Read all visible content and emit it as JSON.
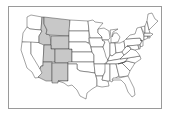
{
  "map": {
    "title": "Contiguous United States",
    "highlight_color": "#c8c8c8",
    "default_color": "#ffffff",
    "border_color": "#333333",
    "frame_color": "#9a9a9a",
    "highlighted_states": [
      "Idaho",
      "Montana",
      "Wyoming",
      "Utah",
      "Colorado",
      "Arizona",
      "New Mexico"
    ],
    "states": [
      {
        "name": "Washington",
        "highlighted": false
      },
      {
        "name": "Oregon",
        "highlighted": false
      },
      {
        "name": "California",
        "highlighted": false
      },
      {
        "name": "Nevada",
        "highlighted": false
      },
      {
        "name": "Idaho",
        "highlighted": true
      },
      {
        "name": "Montana",
        "highlighted": true
      },
      {
        "name": "Wyoming",
        "highlighted": true
      },
      {
        "name": "Utah",
        "highlighted": true
      },
      {
        "name": "Colorado",
        "highlighted": true
      },
      {
        "name": "Arizona",
        "highlighted": true
      },
      {
        "name": "New Mexico",
        "highlighted": true
      },
      {
        "name": "North Dakota",
        "highlighted": false
      },
      {
        "name": "South Dakota",
        "highlighted": false
      },
      {
        "name": "Nebraska",
        "highlighted": false
      },
      {
        "name": "Kansas",
        "highlighted": false
      },
      {
        "name": "Oklahoma",
        "highlighted": false
      },
      {
        "name": "Texas",
        "highlighted": false
      },
      {
        "name": "Minnesota",
        "highlighted": false
      },
      {
        "name": "Iowa",
        "highlighted": false
      },
      {
        "name": "Missouri",
        "highlighted": false
      },
      {
        "name": "Arkansas",
        "highlighted": false
      },
      {
        "name": "Louisiana",
        "highlighted": false
      },
      {
        "name": "Wisconsin",
        "highlighted": false
      },
      {
        "name": "Illinois",
        "highlighted": false
      },
      {
        "name": "Michigan",
        "highlighted": false
      },
      {
        "name": "Indiana",
        "highlighted": false
      },
      {
        "name": "Ohio",
        "highlighted": false
      },
      {
        "name": "Kentucky",
        "highlighted": false
      },
      {
        "name": "Tennessee",
        "highlighted": false
      },
      {
        "name": "Mississippi",
        "highlighted": false
      },
      {
        "name": "Alabama",
        "highlighted": false
      },
      {
        "name": "Georgia",
        "highlighted": false
      },
      {
        "name": "Florida",
        "highlighted": false
      },
      {
        "name": "South Carolina",
        "highlighted": false
      },
      {
        "name": "North Carolina",
        "highlighted": false
      },
      {
        "name": "Virginia",
        "highlighted": false
      },
      {
        "name": "West Virginia",
        "highlighted": false
      },
      {
        "name": "Pennsylvania",
        "highlighted": false
      },
      {
        "name": "New York",
        "highlighted": false
      },
      {
        "name": "Maryland",
        "highlighted": false
      },
      {
        "name": "New Jersey",
        "highlighted": false
      },
      {
        "name": "Delaware",
        "highlighted": false
      },
      {
        "name": "Connecticut",
        "highlighted": false
      },
      {
        "name": "Rhode Island",
        "highlighted": false
      },
      {
        "name": "Massachusetts",
        "highlighted": false
      },
      {
        "name": "Vermont",
        "highlighted": false
      },
      {
        "name": "New Hampshire",
        "highlighted": false
      },
      {
        "name": "Maine",
        "highlighted": false
      }
    ]
  }
}
